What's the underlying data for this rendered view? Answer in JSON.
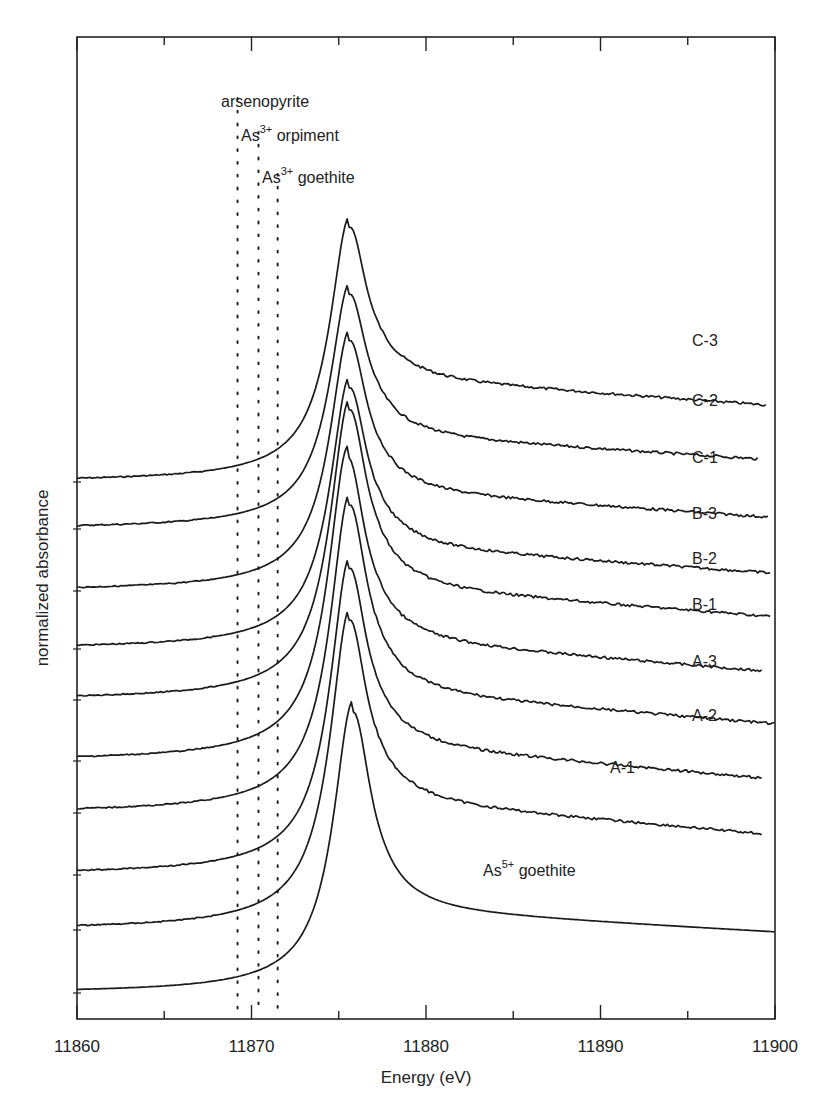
{
  "chart_data": {
    "type": "line",
    "title": "",
    "xlabel": "Energy (eV)",
    "ylabel": "normalized absorbance",
    "xlim": [
      11860,
      11900
    ],
    "x_ticks": [
      11860,
      11870,
      11880,
      11890,
      11900
    ],
    "x_minor_ticks": [
      11865,
      11875,
      11885,
      11895
    ],
    "grid": false,
    "legend": "inline labels to the right of each trace",
    "reference_lines": [
      {
        "label": "arsenopyrite",
        "energy": 11869.2,
        "style": "dotted"
      },
      {
        "label": "As3+ orpiment",
        "energy": 11870.4,
        "style": "dotted"
      },
      {
        "label": "As3+ goethite",
        "energy": 11871.5,
        "style": "dotted"
      }
    ],
    "series": [
      {
        "name": "C-3",
        "peak_energy": 11875.6,
        "baseline_px": 482,
        "peak_px": 187,
        "post_edge_px": 380,
        "end_energy": 11899.5
      },
      {
        "name": "C-2",
        "peak_energy": 11875.6,
        "baseline_px": 529,
        "peak_px": 258,
        "post_edge_px": 437,
        "end_energy": 11899.0
      },
      {
        "name": "C-1",
        "peak_energy": 11875.6,
        "baseline_px": 591,
        "peak_px": 302,
        "post_edge_px": 493,
        "end_energy": 11899.6
      },
      {
        "name": "B-3",
        "peak_energy": 11875.6,
        "baseline_px": 649,
        "peak_px": 348,
        "post_edge_px": 548,
        "end_energy": 11899.8
      },
      {
        "name": "B-2",
        "peak_energy": 11875.6,
        "baseline_px": 700,
        "peak_px": 366,
        "post_edge_px": 589,
        "end_energy": 11899.8
      },
      {
        "name": "B-1",
        "peak_energy": 11875.5,
        "baseline_px": 761,
        "peak_px": 411,
        "post_edge_px": 642,
        "end_energy": 11899.3
      },
      {
        "name": "A-3",
        "peak_energy": 11875.6,
        "baseline_px": 813,
        "peak_px": 458,
        "post_edge_px": 694,
        "end_energy": 11900.0
      },
      {
        "name": "A-2",
        "peak_energy": 11875.6,
        "baseline_px": 875,
        "peak_px": 518,
        "post_edge_px": 747,
        "end_energy": 11899.3
      },
      {
        "name": "A-1",
        "peak_energy": 11875.6,
        "baseline_px": 930,
        "peak_px": 570,
        "post_edge_px": 803,
        "end_energy": 11899.3
      },
      {
        "name": "As5+ goethite",
        "peak_energy": 11875.8,
        "baseline_px": 993,
        "peak_px": 680,
        "post_edge_px": 912,
        "end_energy": 11900.0
      }
    ],
    "series_labels": [
      {
        "text": "C-3",
        "x": 692,
        "y": 346
      },
      {
        "text": "C-2",
        "x": 692,
        "y": 406
      },
      {
        "text": "C-1",
        "x": 692,
        "y": 463
      },
      {
        "text": "B-3",
        "x": 692,
        "y": 519
      },
      {
        "text": "B-2",
        "x": 692,
        "y": 564
      },
      {
        "text": "B-1",
        "x": 692,
        "y": 610
      },
      {
        "text": "A-3",
        "x": 692,
        "y": 667
      },
      {
        "text": "A-2",
        "x": 692,
        "y": 721
      },
      {
        "text": "A-1",
        "x": 610,
        "y": 773
      }
    ],
    "reference_labels": {
      "arsenopyrite": "arsenopyrite",
      "orpiment_base": "As",
      "orpiment_sup": "3+",
      "orpiment_rest": " orpiment",
      "goethite3_base": "As",
      "goethite3_sup": "3+",
      "goethite3_rest": " goethite",
      "goethite5_base": "As",
      "goethite5_sup": "5+",
      "goethite5_rest": " goethite"
    },
    "frame": {
      "left": 77,
      "top": 37,
      "right": 775,
      "bottom": 1019
    }
  },
  "axis": {
    "x_tick_labels": [
      "11860",
      "11870",
      "11880",
      "11890",
      "11900"
    ],
    "xlabel": "Energy (eV)",
    "ylabel": "normalized absorbance"
  }
}
